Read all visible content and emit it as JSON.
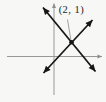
{
  "figure": {
    "canvas": {
      "width": 106,
      "height": 102
    },
    "colors": {
      "background": "#f7f7f5",
      "axis": "#8c8c8c",
      "line": "#161616",
      "leader": "#7a7a7a",
      "label": "#1c1c1c"
    },
    "label": {
      "text": "(2, 1)",
      "x": 71.5,
      "top": 4.5,
      "font_size": 10.5
    },
    "point": {
      "x": 71.5,
      "y": 42.3,
      "radius": 2.3
    },
    "leader": {
      "x1": 67.5,
      "y1": 19.5,
      "x2": 70.8,
      "y2": 39.5,
      "width": 0.7
    },
    "axes": [
      {
        "name": "x-axis",
        "x1": 7,
        "y1": 56.5,
        "x2": 102,
        "y2": 56.5,
        "arrow_head": 4.5,
        "width": 0.9
      },
      {
        "name": "y-axis",
        "x1": 54,
        "y1": 95,
        "x2": 54,
        "y2": 3.5,
        "arrow_head": 4.5,
        "width": 0.9
      }
    ],
    "lines": [
      {
        "name": "line-negative-slope",
        "x1": 43,
        "y1": 7.5,
        "x2": 95.5,
        "y2": 71.5,
        "arrow_head": 7,
        "width": 1.7
      },
      {
        "name": "line-positive-slope",
        "x1": 43.5,
        "y1": 73,
        "x2": 92.5,
        "y2": 20,
        "arrow_head": 7,
        "width": 1.7
      }
    ]
  }
}
